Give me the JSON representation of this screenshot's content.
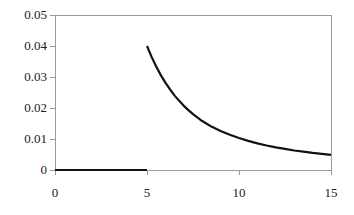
{
  "chart_data": {
    "type": "line",
    "title": "",
    "subtitle": "",
    "xlabel": "",
    "ylabel": "",
    "xlim": [
      0,
      15
    ],
    "ylim": [
      0,
      0.05
    ],
    "xticks": [
      0,
      5,
      10,
      15
    ],
    "xtick_labels": [
      "0",
      "5",
      "10",
      "15"
    ],
    "yticks": [
      0,
      0.01,
      0.02,
      0.03,
      0.04,
      0.05
    ],
    "ytick_labels": [
      "0",
      "0.01",
      "0.02",
      "0.03",
      "0.04",
      "0.05"
    ],
    "grid": false,
    "legend": null,
    "legend_position": "none",
    "annotations": [],
    "axis_color": "#9a9a9a",
    "line_color": "#111111",
    "line_width": 2.2,
    "series": [
      {
        "name": "density",
        "x": [
          0,
          0.5,
          1,
          1.5,
          2,
          2.5,
          3,
          3.5,
          4,
          4.5,
          5
        ],
        "values": [
          0,
          0,
          0,
          0,
          0,
          0,
          0,
          0,
          0,
          0,
          0
        ]
      },
      {
        "name": "tail",
        "x": [
          5,
          5.25,
          5.5,
          5.75,
          6,
          6.25,
          6.5,
          6.75,
          7,
          7.25,
          7.5,
          7.75,
          8,
          8.5,
          9,
          9.5,
          10,
          10.5,
          11,
          11.5,
          12,
          12.5,
          13,
          13.5,
          14,
          14.5,
          15
        ],
        "values": [
          0.04,
          0.0365,
          0.0334,
          0.0306,
          0.0282,
          0.026,
          0.024,
          0.0223,
          0.0207,
          0.0193,
          0.018,
          0.0169,
          0.0158,
          0.014,
          0.0126,
          0.0114,
          0.0103,
          0.0094,
          0.0086,
          0.0079,
          0.0073,
          0.0068,
          0.0063,
          0.0059,
          0.0055,
          0.0052,
          0.0049
        ]
      }
    ]
  },
  "geometry": {
    "plot_left": 55,
    "plot_right": 331,
    "plot_top": 15,
    "plot_bottom": 170,
    "tick_len": 5
  }
}
